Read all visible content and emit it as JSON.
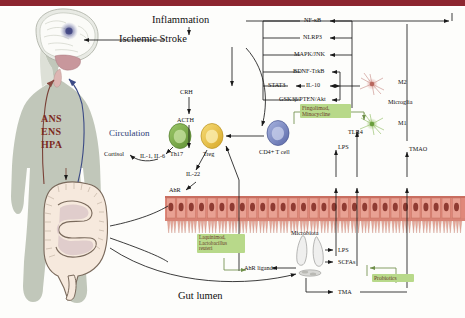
{
  "figure": {
    "title_bar_color": "#8d2630",
    "accent_green": "#b8d98a",
    "accent_red": "#7d2a1e",
    "accent_blue": "#2e3f78"
  },
  "brain_body": {
    "ans": "ANS",
    "ens": "ENS",
    "hpa": "HPA",
    "circulation": "Circulation"
  },
  "brain_outcomes": {
    "inflammation": "Inflammation",
    "ischemic_stroke": "Ischemic Stroke"
  },
  "hpa_axis": {
    "crh": "CRH",
    "acth": "ACTH",
    "cortisol": "Cortisol"
  },
  "pathways": [
    {
      "label": "NF-κB"
    },
    {
      "label": "NLRP3"
    },
    {
      "label": "MAPK/JNK"
    },
    {
      "label": "BDNF-TrkB"
    },
    {
      "label": "STAT3"
    },
    {
      "label": "GSK3β/PTEN/Akt"
    }
  ],
  "cytokines": {
    "il10": "IL-10",
    "il1_il6": "IL-1, IL-6",
    "il22": "IL-22"
  },
  "immune_cells": {
    "th17": "Th17",
    "treg": "Treg",
    "cd4": "CD4+ T cell"
  },
  "microglia": {
    "group_label": "Microglia",
    "m1": "M1",
    "m2": "M2"
  },
  "receptors": {
    "tlr4": "TLR4",
    "ahr": "AhR"
  },
  "metabolites": {
    "lps": "LPS",
    "scfas": "SCFAs",
    "tma": "TMA",
    "tmao": "TMAO",
    "ahr_ligands": "AhR ligands"
  },
  "gut": {
    "lumen_label": "Gut lumen",
    "microbiota_label": "Microbiota"
  },
  "treatments": [
    {
      "name": "fingolimod-minocycline",
      "line1": "Fingolimod,",
      "line2": "Minocycline",
      "line3": ""
    },
    {
      "name": "laquinimod-lactobacillus",
      "line1": "Laquinimod,",
      "line2": "Lactobacillus",
      "line3": "reuteri"
    },
    {
      "name": "probiotics",
      "line1": "Probiotics",
      "line2": "",
      "line3": ""
    }
  ]
}
